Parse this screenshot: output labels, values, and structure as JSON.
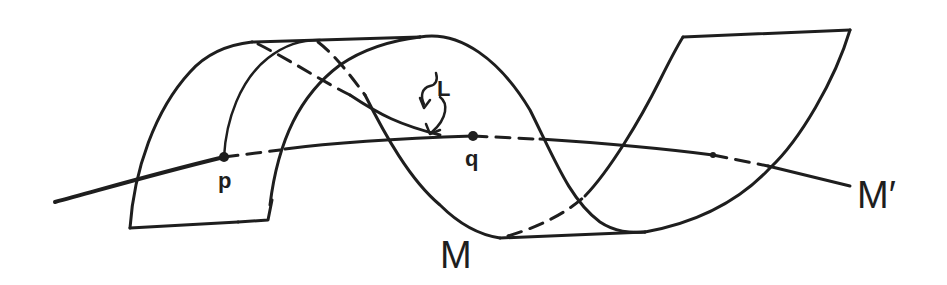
{
  "figure": {
    "colors": {
      "ink": "#1e1e1e",
      "background": "#ffffff"
    }
  },
  "labels": {
    "p": "p",
    "q": "q",
    "L": "L",
    "M": "M",
    "M_prime": "M′"
  },
  "points": [
    {
      "name": "p",
      "x": 224,
      "y": 157
    },
    {
      "name": "q",
      "x": 473,
      "y": 136
    },
    {
      "name": "end-mark",
      "x": 713,
      "y": 155
    }
  ]
}
